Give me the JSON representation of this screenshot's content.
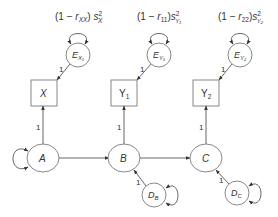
{
  "diagram": {
    "type": "path-diagram",
    "colors": {
      "stroke": "#7a7a7a",
      "edge": "#555555",
      "text": "#333333",
      "background": "#ffffff"
    },
    "variance_labels": [
      {
        "id": "ex1",
        "pre": "(1 − ",
        "r": "r",
        "r_sub": "XX",
        "post": ") ",
        "s": "s",
        "s_sup": "2",
        "s_sub": "X"
      },
      {
        "id": "ey1",
        "pre": "(1 − ",
        "r": "r",
        "r_sub": "11",
        "post": ")",
        "s": "s",
        "s_sup": "2",
        "s_sub": "Y₁"
      },
      {
        "id": "ey2",
        "pre": "(1 − ",
        "r": "r",
        "r_sub": "22",
        "post": ")",
        "s": "s",
        "s_sup": "2",
        "s_sub": "Y₂"
      }
    ],
    "error_nodes": [
      {
        "id": "ex1",
        "main": "E",
        "sub": "X₁"
      },
      {
        "id": "ey1",
        "main": "E",
        "sub": "Y₁"
      },
      {
        "id": "ey2",
        "main": "E",
        "sub": "Y₂"
      }
    ],
    "observed_nodes": [
      {
        "id": "x",
        "main": "X",
        "sub": ""
      },
      {
        "id": "y1",
        "main": "Y",
        "sub": "1"
      },
      {
        "id": "y2",
        "main": "Y",
        "sub": "2"
      }
    ],
    "latent_nodes": [
      {
        "id": "a",
        "label": "A"
      },
      {
        "id": "b",
        "label": "B"
      },
      {
        "id": "c",
        "label": "C"
      }
    ],
    "disturbance_nodes": [
      {
        "id": "db",
        "main": "D",
        "sub": "B"
      },
      {
        "id": "dc",
        "main": "D",
        "sub": "C"
      }
    ],
    "path_labels": {
      "ex1_to_x": "1",
      "ey1_to_y1": "1",
      "ey2_to_y2": "1",
      "a_to_x": "1",
      "b_to_y1": "1",
      "c_to_y2": "1",
      "db_to_b": "1",
      "dc_to_c": "1"
    },
    "edges": [
      {
        "from": "E_X1",
        "to": "X"
      },
      {
        "from": "E_Y1",
        "to": "Y1"
      },
      {
        "from": "E_Y2",
        "to": "Y2"
      },
      {
        "from": "A",
        "to": "X"
      },
      {
        "from": "B",
        "to": "Y1"
      },
      {
        "from": "C",
        "to": "Y2"
      },
      {
        "from": "A",
        "to": "B"
      },
      {
        "from": "B",
        "to": "C"
      },
      {
        "from": "D_B",
        "to": "B"
      },
      {
        "from": "D_C",
        "to": "C"
      }
    ]
  }
}
